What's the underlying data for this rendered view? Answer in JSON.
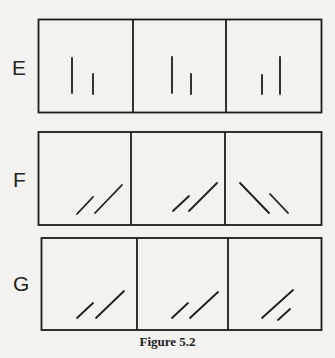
{
  "figure": {
    "caption": "Figure 5.2",
    "rows": [
      {
        "label": "E",
        "description": "Two vertical strokes, taller and shorter, shifting position across three panels",
        "panels": [
          {
            "strokes": [
              {
                "x1": 72,
                "y1": 58,
                "x2": 72,
                "y2": 93
              },
              {
                "x1": 93,
                "y1": 74,
                "x2": 93,
                "y2": 94
              }
            ]
          },
          {
            "strokes": [
              {
                "x1": 172,
                "y1": 57,
                "x2": 172,
                "y2": 93
              },
              {
                "x1": 191,
                "y1": 74,
                "x2": 191,
                "y2": 94
              }
            ]
          },
          {
            "strokes": [
              {
                "x1": 262,
                "y1": 75,
                "x2": 262,
                "y2": 94
              },
              {
                "x1": 280,
                "y1": 57,
                "x2": 280,
                "y2": 94
              }
            ]
          }
        ]
      },
      {
        "label": "F",
        "description": "Pairs of diagonal strokes; third panel mirrored",
        "panels": [
          {
            "strokes": [
              {
                "x1": 77,
                "y1": 214,
                "x2": 93,
                "y2": 197
              },
              {
                "x1": 95,
                "y1": 213,
                "x2": 122,
                "y2": 185
              }
            ]
          },
          {
            "strokes": [
              {
                "x1": 173,
                "y1": 211,
                "x2": 189,
                "y2": 196
              },
              {
                "x1": 189,
                "y1": 211,
                "x2": 217,
                "y2": 183
              }
            ]
          },
          {
            "strokes": [
              {
                "x1": 240,
                "y1": 183,
                "x2": 269,
                "y2": 213
              },
              {
                "x1": 270,
                "y1": 194,
                "x2": 288,
                "y2": 213
              }
            ]
          }
        ]
      },
      {
        "label": "G",
        "description": "Pairs of parallel diagonal strokes; third panel with shorter second stroke",
        "panels": [
          {
            "strokes": [
              {
                "x1": 77,
                "y1": 318,
                "x2": 93,
                "y2": 303
              },
              {
                "x1": 96,
                "y1": 318,
                "x2": 124,
                "y2": 291
              }
            ]
          },
          {
            "strokes": [
              {
                "x1": 172,
                "y1": 318,
                "x2": 188,
                "y2": 303
              },
              {
                "x1": 190,
                "y1": 318,
                "x2": 218,
                "y2": 292
              }
            ]
          },
          {
            "strokes": [
              {
                "x1": 262,
                "y1": 318,
                "x2": 293,
                "y2": 290
              },
              {
                "x1": 278,
                "y1": 320,
                "x2": 290,
                "y2": 309
              }
            ]
          }
        ]
      }
    ]
  }
}
